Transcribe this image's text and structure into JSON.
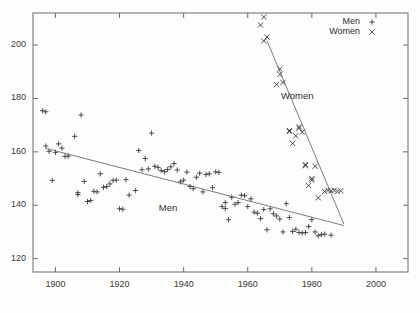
{
  "chart_data": {
    "type": "scatter",
    "title": "",
    "xlabel": "",
    "ylabel": "",
    "xlim": [
      1893,
      2010
    ],
    "ylim": [
      115,
      212
    ],
    "xticks": [
      1900,
      1920,
      1940,
      1960,
      1980,
      2000
    ],
    "yticks": [
      120,
      140,
      160,
      180,
      200
    ],
    "grid": false,
    "legend_position": "top-right",
    "legend": [
      {
        "name": "Men",
        "marker": "plus"
      },
      {
        "name": "Women",
        "marker": "cross"
      }
    ],
    "annotations": [
      {
        "text": "Men",
        "x": 1936,
        "y": 139
      },
      {
        "text": "Women",
        "x": 1976,
        "y": 181
      }
    ],
    "series": [
      {
        "name": "Men",
        "marker": "plus",
        "color": "#3b3b3b",
        "points": [
          [
            1896,
            175.4
          ],
          [
            1897,
            175.0
          ],
          [
            1897,
            162.2
          ],
          [
            1898,
            160.2
          ],
          [
            1899,
            149.3
          ],
          [
            1900,
            159.8
          ],
          [
            1901,
            163.0
          ],
          [
            1902,
            161.4
          ],
          [
            1903,
            158.3
          ],
          [
            1904,
            158.4
          ],
          [
            1906,
            165.8
          ],
          [
            1907,
            144.7
          ],
          [
            1907,
            144.0
          ],
          [
            1908,
            173.8
          ],
          [
            1909,
            148.9
          ],
          [
            1910,
            141.4
          ],
          [
            1911,
            141.8
          ],
          [
            1912,
            145.2
          ],
          [
            1913,
            145.0
          ],
          [
            1914,
            151.8
          ],
          [
            1915,
            146.7
          ],
          [
            1916,
            147.0
          ],
          [
            1917,
            148.0
          ],
          [
            1918,
            149.3
          ],
          [
            1919,
            149.4
          ],
          [
            1920,
            138.7
          ],
          [
            1921,
            138.5
          ],
          [
            1922,
            149.6
          ],
          [
            1923,
            143.8
          ],
          [
            1925,
            145.5
          ],
          [
            1926,
            160.5
          ],
          [
            1927,
            153.3
          ],
          [
            1928,
            157.5
          ],
          [
            1929,
            153.6
          ],
          [
            1930,
            167.0
          ],
          [
            1931,
            154.6
          ],
          [
            1932,
            154.2
          ],
          [
            1933,
            153.0
          ],
          [
            1934,
            152.6
          ],
          [
            1935,
            153.4
          ],
          [
            1936,
            154.4
          ],
          [
            1937,
            155.6
          ],
          [
            1938,
            153.2
          ],
          [
            1939,
            148.8
          ],
          [
            1940,
            149.4
          ],
          [
            1941,
            152.4
          ],
          [
            1942,
            147.0
          ],
          [
            1943,
            146.2
          ],
          [
            1944,
            150.5
          ],
          [
            1945,
            152.0
          ],
          [
            1946,
            145.0
          ],
          [
            1947,
            151.5
          ],
          [
            1948,
            151.8
          ],
          [
            1949,
            146.6
          ],
          [
            1950,
            152.5
          ],
          [
            1951,
            152.3
          ],
          [
            1952,
            139.5
          ],
          [
            1953,
            141.0
          ],
          [
            1953,
            138.8
          ],
          [
            1954,
            134.6
          ],
          [
            1955,
            143.0
          ],
          [
            1956,
            140.4
          ],
          [
            1957,
            141.0
          ],
          [
            1958,
            143.8
          ],
          [
            1959,
            143.6
          ],
          [
            1960,
            139.5
          ],
          [
            1961,
            142.4
          ],
          [
            1962,
            137.4
          ],
          [
            1963,
            137.0
          ],
          [
            1964,
            135.0
          ],
          [
            1965,
            138.4
          ],
          [
            1966,
            130.8
          ],
          [
            1967,
            138.7
          ],
          [
            1968,
            136.8
          ],
          [
            1969,
            136.0
          ],
          [
            1970,
            134.8
          ],
          [
            1971,
            130.0
          ],
          [
            1972,
            140.6
          ],
          [
            1973,
            135.4
          ],
          [
            1974,
            130.2
          ],
          [
            1975,
            131.0
          ],
          [
            1976,
            129.8
          ],
          [
            1977,
            129.6
          ],
          [
            1978,
            129.8
          ],
          [
            1979,
            132.0
          ],
          [
            1980,
            134.6
          ],
          [
            1981,
            130.0
          ],
          [
            1982,
            128.6
          ],
          [
            1983,
            129.0
          ],
          [
            1984,
            129.2
          ],
          [
            1986,
            128.8
          ]
        ]
      },
      {
        "name": "Women",
        "marker": "cross",
        "color": "#3b3b3b",
        "points": [
          [
            1964,
            207.5
          ],
          [
            1965,
            210.5
          ],
          [
            1965,
            201.5
          ],
          [
            1966,
            203.0
          ],
          [
            1969,
            185.2
          ],
          [
            1970,
            189.0
          ],
          [
            1970,
            191.0
          ],
          [
            1971,
            186.0
          ],
          [
            1973,
            167.6
          ],
          [
            1973,
            168.0
          ],
          [
            1974,
            163.2
          ],
          [
            1975,
            166.0
          ],
          [
            1976,
            168.8
          ],
          [
            1976,
            169.4
          ],
          [
            1977,
            167.4
          ],
          [
            1978,
            155.2
          ],
          [
            1978,
            154.8
          ],
          [
            1979,
            147.4
          ],
          [
            1980,
            150.0
          ],
          [
            1980,
            149.4
          ],
          [
            1981,
            154.6
          ],
          [
            1982,
            142.8
          ],
          [
            1984,
            145.2
          ],
          [
            1985,
            145.6
          ],
          [
            1986,
            145.4
          ],
          [
            1987,
            145.6
          ],
          [
            1988,
            145.2
          ],
          [
            1989,
            145.4
          ]
        ]
      }
    ],
    "trendlines": [
      {
        "name": "Men",
        "x0": 1897,
        "y0": 161.3,
        "x1": 1990,
        "y1": 132.4
      },
      {
        "name": "Women",
        "x0": 1966,
        "y0": 201.6,
        "x1": 1990,
        "y1": 133.0
      }
    ]
  }
}
